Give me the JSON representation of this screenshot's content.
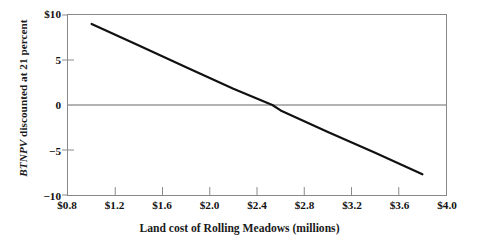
{
  "chart_data": {
    "type": "line",
    "title": "",
    "subtitle": "",
    "xlabel": "Land cost of Rolling Meadows (millions)",
    "ylabel": "BTNPV discounted at 21 percent",
    "ylabel_italic_part": "BTNPV",
    "ylabel_roman_part": " discounted at 21 percent",
    "xlim": [
      0.8,
      4.0
    ],
    "ylim": [
      -10,
      10
    ],
    "grid": false,
    "legend": "none",
    "xticks": [
      0.8,
      1.2,
      1.6,
      2.0,
      2.4,
      2.8,
      3.2,
      3.6,
      4.0
    ],
    "xtick_labels": [
      "$0.8",
      "$1.2",
      "$1.6",
      "$2.0",
      "$2.4",
      "$2.8",
      "$3.2",
      "$3.6",
      "$4.0"
    ],
    "yticks": [
      10,
      5,
      0,
      -5,
      -10
    ],
    "ytick_labels": [
      "$10",
      "5",
      "0",
      "−5",
      "−10"
    ],
    "zero_line": {
      "value": 0,
      "color": "#9a9a9a",
      "visible": true
    },
    "series": [
      {
        "name": "BTNPV",
        "color": "#111111",
        "linewidth": 2.2,
        "x": [
          1.0,
          3.8
        ],
        "values": [
          9.0,
          -7.7
        ],
        "points": [
          {
            "x": 1.0,
            "y": 9.0
          },
          {
            "x": 1.4,
            "y": 6.6
          },
          {
            "x": 1.8,
            "y": 4.2
          },
          {
            "x": 2.2,
            "y": 1.8
          },
          {
            "x": 2.53,
            "y": 0.0
          },
          {
            "x": 2.6,
            "y": -0.6
          },
          {
            "x": 3.0,
            "y": -3.0
          },
          {
            "x": 3.4,
            "y": -5.3
          },
          {
            "x": 3.8,
            "y": -7.7
          }
        ],
        "x_intercept": 2.53,
        "slope_per_million": -5.96
      }
    ]
  },
  "axes": {
    "frame_color": "#888888",
    "tick_color": "#8a8a8a",
    "text_color": "#111111"
  }
}
